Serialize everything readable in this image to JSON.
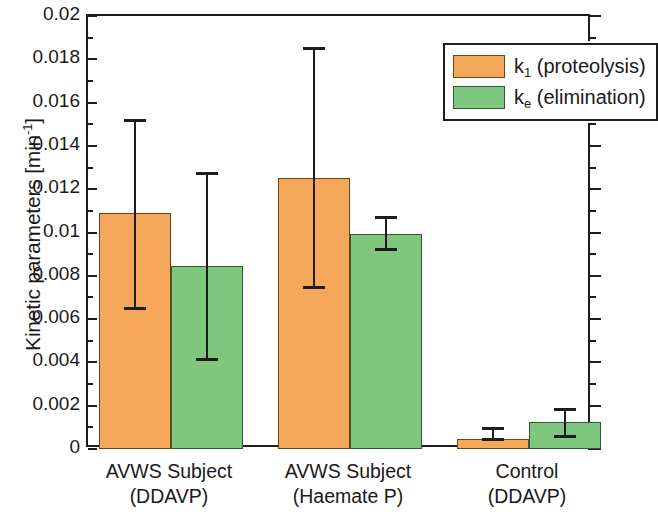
{
  "chart_data": {
    "type": "bar",
    "title": "",
    "xlabel": "",
    "ylabel": "Kinetic parameters [min-1]",
    "ylabel_base": "Kinetic parameters [min",
    "ylabel_exp": "-1",
    "ylabel_tail": "]",
    "ylim": [
      0,
      0.02
    ],
    "grid": false,
    "legend_position": "top-right",
    "categories": [
      "AVWS Subject (DDAVP)",
      "AVWS Subject (Haemate P)",
      "Control (DDAVP)"
    ],
    "category_lines": [
      [
        "AVWS Subject",
        "(DDAVP)"
      ],
      [
        "AVWS Subject",
        "(Haemate P)"
      ],
      [
        "Control",
        "(DDAVP)"
      ]
    ],
    "series": [
      {
        "name": "k1 (proteolysis)",
        "color": "#f5a85a",
        "values": [
          0.0109,
          0.0125,
          0.00045
        ],
        "err_upper": [
          0.0152,
          0.0185,
          0.00095
        ],
        "err_lower": [
          0.0065,
          0.0075,
          0.00045
        ]
      },
      {
        "name": "ke (elimination)",
        "color": "#7fc67f",
        "values": [
          0.00845,
          0.00995,
          0.00125
        ],
        "err_upper": [
          0.01275,
          0.0107,
          0.00185
        ],
        "err_lower": [
          0.00415,
          0.00925,
          0.0006
        ]
      }
    ],
    "ytick_labels": [
      "0",
      "0.002",
      "0.004",
      "0.006",
      "0.008",
      "0.01",
      "0.012",
      "0.014",
      "0.016",
      "0.018",
      "0.02"
    ],
    "ytick_values": [
      0,
      0.002,
      0.004,
      0.006,
      0.008,
      0.01,
      0.012,
      0.014,
      0.016,
      0.018,
      0.02
    ],
    "yminor_step": 0.001
  },
  "legend": {
    "items": [
      {
        "symbol": "k",
        "subscript": "1",
        "label": " (proteolysis)",
        "color": "#f5a85a"
      },
      {
        "symbol": "k",
        "subscript": "e",
        "label": " (elimination)",
        "color": "#7fc67f"
      }
    ]
  }
}
